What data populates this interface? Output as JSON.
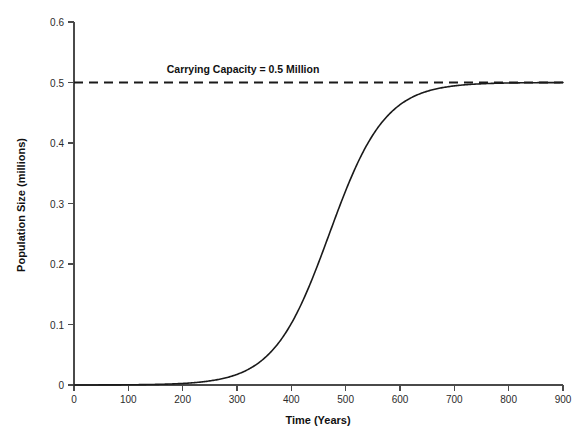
{
  "chart_data": {
    "type": "line",
    "title": "",
    "xlabel": "Time (Years)",
    "ylabel": "Population Size (millions)",
    "xlim": [
      0,
      900
    ],
    "ylim": [
      0,
      0.6
    ],
    "xticks": [
      "0",
      "100",
      "200",
      "300",
      "400",
      "500",
      "600",
      "700",
      "800",
      "900"
    ],
    "yticks": [
      "0",
      "0.1",
      "0.2",
      "0.3",
      "0.4",
      "0.5",
      "0.6"
    ],
    "xtick_values": [
      0,
      100,
      200,
      300,
      400,
      500,
      600,
      700,
      800,
      900
    ],
    "ytick_values": [
      0,
      0.1,
      0.2,
      0.3,
      0.4,
      0.5,
      0.6
    ],
    "grid": false,
    "legend": false,
    "legend_position": "none",
    "annotations": [
      {
        "text": "Carrying Capacity = 0.5 Million",
        "x": 300,
        "y": 0.535,
        "color": "#111111",
        "bold": true
      }
    ],
    "series": [
      {
        "name": "Logistic population growth",
        "style": "solid",
        "color": "#1a1a1a",
        "linewidth": 1.6,
        "model": "logistic",
        "K": 0.5,
        "midpoint_year": 470,
        "growth_rate": 0.0195,
        "x": [
          0,
          25,
          50,
          75,
          100,
          125,
          150,
          175,
          200,
          225,
          250,
          275,
          300,
          325,
          350,
          375,
          400,
          425,
          450,
          475,
          500,
          525,
          550,
          575,
          600,
          625,
          650,
          675,
          700,
          725,
          750,
          775,
          800,
          825,
          850,
          875,
          900
        ],
        "values": [
          6e-05,
          9e-05,
          0.00015,
          0.00024,
          0.00039,
          0.00063,
          0.00103,
          0.00167,
          0.00271,
          0.00438,
          0.00704,
          0.01122,
          0.01766,
          0.02734,
          0.04128,
          0.06035,
          0.08478,
          0.11358,
          0.14448,
          0.17473,
          0.20214,
          0.22543,
          0.24412,
          0.25849,
          0.26922,
          0.27706,
          0.28268,
          0.28664,
          0.28941,
          0.29133,
          0.29265,
          0.29356,
          0.29418,
          0.29461,
          0.2949,
          0.2951,
          0.29524
        ]
      },
      {
        "name": "Carrying capacity",
        "style": "dashed",
        "color": "#1a1a1a",
        "linewidth": 1.8,
        "constant_value": 0.5,
        "x": [
          0,
          900
        ],
        "values": [
          0.5,
          0.5
        ]
      }
    ]
  },
  "axes": {
    "x_axis_label": "Time (Years)",
    "y_axis_label": "Population Size (millions)"
  }
}
